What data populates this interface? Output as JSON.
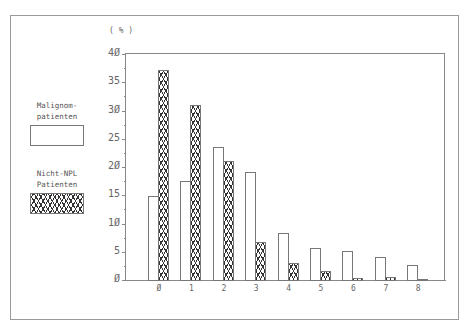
{
  "chart_data": {
    "type": "bar",
    "title": "",
    "unit_label": "( % )",
    "xlabel": "",
    "ylabel": "( % )",
    "ylim": [
      0,
      40
    ],
    "yticks": [
      "Ø",
      "5",
      "1Ø",
      "15",
      "2Ø",
      "25",
      "3Ø",
      "35",
      "4Ø"
    ],
    "categories": [
      "Ø",
      "1",
      "2",
      "3",
      "4",
      "5",
      "6",
      "7",
      "8"
    ],
    "series": [
      {
        "name": "Malignom-patienten",
        "pattern": "open",
        "values": [
          14.8,
          17.6,
          23.6,
          19.2,
          8.4,
          5.7,
          5.1,
          4.0,
          2.6
        ]
      },
      {
        "name": "Nicht-NPL Patienten",
        "pattern": "crosshatch",
        "values": [
          37.2,
          31.0,
          21.0,
          6.7,
          3.0,
          1.6,
          0.3,
          0.6,
          0.2
        ]
      }
    ],
    "legend_position": "left",
    "grid": false
  },
  "legend": {
    "malignom_line1": "Malignom-",
    "malignom_line2": "patienten",
    "nichtnpl_line1": "Nicht-NPL",
    "nichtnpl_line2": "Patienten"
  }
}
